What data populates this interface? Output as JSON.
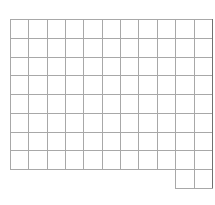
{
  "grid": {
    "origin_x": 10,
    "origin_y": 19,
    "cell_width": 18.35,
    "cell_height": 18.75,
    "columns": 11,
    "rows": 8,
    "line_color": "#a8a8a8",
    "edge_color": "#707070",
    "background": "#ffffff",
    "extra_row": {
      "start_column": 9,
      "end_column": 11
    }
  }
}
